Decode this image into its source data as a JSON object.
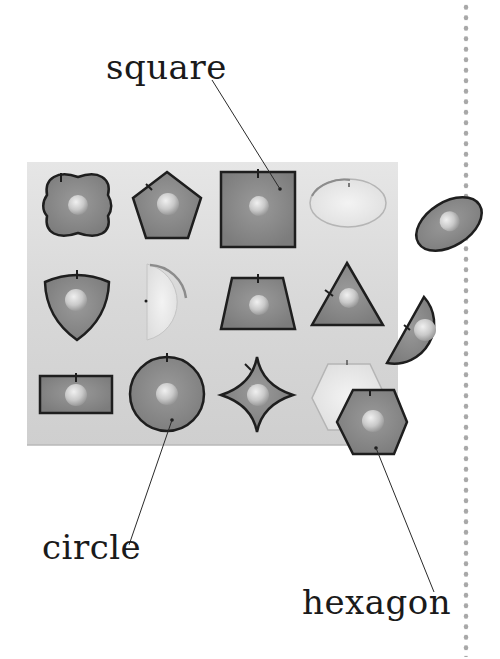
{
  "labels": {
    "square": "square",
    "circle": "circle",
    "hexagon": "hexagon"
  },
  "board": {
    "description": "wooden shape puzzle board",
    "rows": [
      [
        "quatrefoil",
        "pentagon",
        "square",
        "oval-hole"
      ],
      [
        "reuleaux-triangle",
        "semicircle-hole",
        "trapezoid",
        "triangle"
      ],
      [
        "rectangle",
        "circle",
        "curved-star",
        "hexagon-hole"
      ]
    ],
    "loose_pieces": [
      "oval",
      "semicircle",
      "hexagon"
    ]
  },
  "colors": {
    "board": "#dcdcdc",
    "piece_fill": "#8a8a8a",
    "piece_stroke": "#1e1e1e",
    "knob": "#cfcfcf",
    "dots": "#a8a8a8",
    "text": "#1a1a1a"
  }
}
